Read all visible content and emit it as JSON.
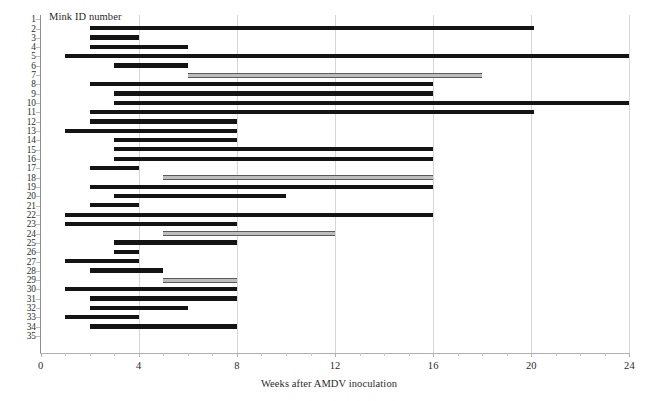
{
  "chart_data": {
    "type": "bar",
    "orientation": "horizontal",
    "subtype": "gantt-range",
    "title": "",
    "xlabel": "Weeks after AMDV inoculation",
    "ylabel": "Mink ID number",
    "xlim": [
      0,
      24
    ],
    "ylim": [
      1,
      35
    ],
    "grid": true,
    "grid_axis": "x",
    "legend": "none",
    "xticks": [
      0,
      4,
      8,
      12,
      16,
      20,
      24
    ],
    "xtick_labels": [
      "0",
      "4",
      "8",
      "12",
      "16",
      "20",
      "24"
    ],
    "x_minor_step": 1,
    "ytick_labels": [
      "1",
      "2",
      "3",
      "4",
      "5",
      "6",
      "7",
      "8",
      "9",
      "10",
      "11",
      "12",
      "13",
      "14",
      "15",
      "16",
      "17",
      "18",
      "19",
      "20",
      "21",
      "22",
      "23",
      "24",
      "25",
      "26",
      "27",
      "28",
      "29",
      "30",
      "31",
      "32",
      "33",
      "34",
      "35"
    ],
    "series": [
      {
        "name": "black-bar",
        "color": "#141414",
        "description": "solid black interval bar"
      },
      {
        "name": "grey-bar",
        "color": "#bdbdbd",
        "description": "outlined grey interval bar"
      }
    ],
    "bars": [
      {
        "id": 1,
        "start": null,
        "end": null,
        "style": "none"
      },
      {
        "id": 2,
        "start": 2,
        "end": 20.1,
        "style": "black"
      },
      {
        "id": 3,
        "start": 2,
        "end": 4,
        "style": "black"
      },
      {
        "id": 4,
        "start": 2,
        "end": 6,
        "style": "black"
      },
      {
        "id": 5,
        "start": 1,
        "end": 24,
        "style": "black"
      },
      {
        "id": 6,
        "start": 3,
        "end": 6,
        "style": "black"
      },
      {
        "id": 7,
        "start": 6,
        "end": 18,
        "style": "grey"
      },
      {
        "id": 8,
        "start": 2,
        "end": 16,
        "style": "black"
      },
      {
        "id": 9,
        "start": 3,
        "end": 16,
        "style": "black"
      },
      {
        "id": 10,
        "start": 3,
        "end": 24,
        "style": "black"
      },
      {
        "id": 11,
        "start": 2,
        "end": 20.1,
        "style": "black"
      },
      {
        "id": 12,
        "start": 2,
        "end": 8,
        "style": "black"
      },
      {
        "id": 13,
        "start": 1,
        "end": 8,
        "style": "black"
      },
      {
        "id": 14,
        "start": 3,
        "end": 8,
        "style": "black"
      },
      {
        "id": 15,
        "start": 3,
        "end": 16,
        "style": "black"
      },
      {
        "id": 16,
        "start": 3,
        "end": 16,
        "style": "black"
      },
      {
        "id": 17,
        "start": 2,
        "end": 4,
        "style": "black"
      },
      {
        "id": 18,
        "start": 5,
        "end": 16,
        "style": "grey"
      },
      {
        "id": 19,
        "start": 2,
        "end": 16,
        "style": "black"
      },
      {
        "id": 20,
        "start": 3,
        "end": 10,
        "style": "black"
      },
      {
        "id": 21,
        "start": 2,
        "end": 4,
        "style": "black"
      },
      {
        "id": 22,
        "start": 1,
        "end": 16,
        "style": "black"
      },
      {
        "id": 23,
        "start": 1,
        "end": 8,
        "style": "black"
      },
      {
        "id": 24,
        "start": 5,
        "end": 12,
        "style": "grey"
      },
      {
        "id": 25,
        "start": 3,
        "end": 8,
        "style": "black"
      },
      {
        "id": 26,
        "start": 3,
        "end": 4,
        "style": "black"
      },
      {
        "id": 27,
        "start": 1,
        "end": 4,
        "style": "black"
      },
      {
        "id": 28,
        "start": 2,
        "end": 5,
        "style": "black"
      },
      {
        "id": 29,
        "start": 5,
        "end": 8,
        "style": "grey"
      },
      {
        "id": 30,
        "start": 1,
        "end": 8,
        "style": "black"
      },
      {
        "id": 31,
        "start": 2,
        "end": 8,
        "style": "black"
      },
      {
        "id": 32,
        "start": 2,
        "end": 6,
        "style": "black"
      },
      {
        "id": 33,
        "start": 1,
        "end": 4,
        "style": "black"
      },
      {
        "id": 34,
        "start": 2,
        "end": 8,
        "style": "black"
      },
      {
        "id": 35,
        "start": null,
        "end": null,
        "style": "none"
      }
    ]
  }
}
